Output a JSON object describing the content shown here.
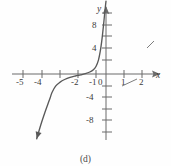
{
  "figure": {
    "caption": "(d)",
    "background_color": "#fefefe",
    "ink_color": "#595959",
    "axis_color": "#6b6b6b"
  },
  "axes": {
    "x_axis_label": "x",
    "y_axis_label": "y",
    "origin_label": "0",
    "x_tick_labels": [
      "-5",
      "-4",
      "-2",
      "-1",
      "1",
      "2"
    ],
    "x_tick_values": [
      -5,
      -4,
      -3,
      -2,
      -1,
      1,
      2
    ],
    "y_tick_labels": [
      "8",
      "4",
      "-4",
      "-8"
    ],
    "y_tick_values": [
      12,
      8,
      4,
      -2,
      -4,
      -6,
      -8,
      -10
    ],
    "x_range": [
      -5.9,
      3.6
    ],
    "y_range": [
      -11.5,
      13.0
    ]
  },
  "chart_data": {
    "type": "line",
    "title": "",
    "xlabel": "x",
    "ylabel": "y",
    "xlim": [
      -5.9,
      3.6
    ],
    "ylim": [
      -11.5,
      13.0
    ],
    "grid": false,
    "legend_position": "none",
    "x_tick_labels": [
      "-5",
      "-4",
      "-3",
      "-2",
      "-1",
      "0",
      "1",
      "2"
    ],
    "y_tick_labels": [
      "8",
      "4",
      "0",
      "-4",
      "-8"
    ],
    "series": [
      {
        "name": "curve",
        "note": "increasing cubic-like curve, x-intercept near x = -3, steep rise near x = -0.3, arrowhead at lower-left end",
        "x": [
          -3.85,
          -3.7,
          -3.55,
          -3.4,
          -3.25,
          -3.1,
          -3.0,
          -2.8,
          -2.55,
          -2.3,
          -2.0,
          -1.7,
          -1.4,
          -1.15,
          -0.9,
          -0.7,
          -0.55,
          -0.42,
          -0.32,
          -0.24,
          -0.18,
          -0.12,
          -0.06,
          0.0
        ],
        "y": [
          -11.2,
          -9.6,
          -8.1,
          -6.7,
          -5.4,
          -4.1,
          -3.2,
          -2.1,
          -1.4,
          -0.95,
          -0.58,
          -0.34,
          -0.15,
          0.05,
          0.35,
          0.75,
          1.35,
          2.4,
          3.9,
          5.6,
          7.2,
          9.0,
          10.9,
          12.6
        ],
        "arrow_start": true,
        "arrow_end": false
      }
    ],
    "stray_marks": [
      {
        "name": "stray-tick-right",
        "x1": 147,
        "y1": 48,
        "x2": 154,
        "y2": 41
      },
      {
        "name": "stray-tick-below-axis",
        "x1": 122,
        "y1": 86,
        "x2": 137,
        "y2": 79
      }
    ]
  }
}
